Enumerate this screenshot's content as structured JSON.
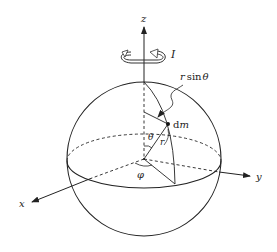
{
  "diagram": {
    "labels": {
      "z_axis": "z",
      "x_axis": "x",
      "y_axis": "y",
      "moment": "I",
      "r_sin_theta_var": "r",
      "r_sin_theta_fn": "sin",
      "r_sin_theta_angle": "θ",
      "mass_element_d": "d",
      "mass_element_m": "m",
      "radius": "r",
      "polar_angle": "θ",
      "azimuth_angle": "φ"
    },
    "colors": {
      "stroke": "#222222",
      "background": "#ffffff"
    }
  }
}
